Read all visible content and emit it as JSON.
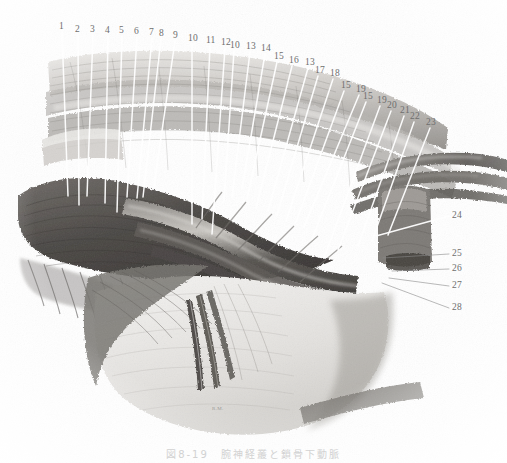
{
  "figure": {
    "type": "anatomical-plate-halftone",
    "title_caption": "図8-19　腕神経叢と鎖骨下動脈",
    "signature": "R.M.",
    "background_color": "#ffffff",
    "ink_color": "#555555",
    "leader_line_color_light": "#ffffff",
    "leader_line_color_dark": "#8a8a8a",
    "label_text_color": "#6e6e6e"
  },
  "labels": [
    {
      "id": "l1",
      "text": "1",
      "x": 59,
      "y": 22,
      "lx": 62,
      "ly": 32,
      "tx": 68,
      "ty": 196,
      "stroke": "light"
    },
    {
      "id": "l2",
      "text": "2",
      "x": 75,
      "y": 25,
      "lx": 78,
      "ly": 35,
      "tx": 79,
      "ty": 205,
      "stroke": "light"
    },
    {
      "id": "l3",
      "text": "3",
      "x": 90,
      "y": 25,
      "lx": 93,
      "ly": 35,
      "tx": 87,
      "ty": 196,
      "stroke": "light"
    },
    {
      "id": "l4",
      "text": "4",
      "x": 105,
      "y": 26,
      "lx": 108,
      "ly": 36,
      "tx": 105,
      "ty": 203,
      "stroke": "light"
    },
    {
      "id": "l5",
      "text": "5",
      "x": 119,
      "y": 26,
      "lx": 122,
      "ly": 36,
      "tx": 117,
      "ty": 212,
      "stroke": "light"
    },
    {
      "id": "l6",
      "text": "6",
      "x": 134,
      "y": 27,
      "lx": 137,
      "ly": 37,
      "tx": 127,
      "ty": 197,
      "stroke": "light"
    },
    {
      "id": "l7",
      "text": "7",
      "x": 149,
      "y": 28,
      "lx": 152,
      "ly": 38,
      "tx": 137,
      "ty": 198,
      "stroke": "light"
    },
    {
      "id": "l8",
      "text": "8",
      "x": 159,
      "y": 29,
      "lx": 161,
      "ly": 39,
      "tx": 143,
      "ty": 197,
      "stroke": "light"
    },
    {
      "id": "l9",
      "text": "9",
      "x": 173,
      "y": 31,
      "lx": 175,
      "ly": 41,
      "tx": 154,
      "ty": 186,
      "stroke": "light"
    },
    {
      "id": "l10a",
      "text": "10",
      "x": 188,
      "y": 34,
      "lx": 192,
      "ly": 44,
      "tx": 192,
      "ty": 224,
      "stroke": "light"
    },
    {
      "id": "l11",
      "text": "11",
      "x": 206,
      "y": 36,
      "lx": 210,
      "ly": 46,
      "tx": 202,
      "ty": 219,
      "stroke": "light"
    },
    {
      "id": "l12",
      "text": "12",
      "x": 221,
      "y": 38,
      "lx": 225,
      "ly": 48,
      "tx": 212,
      "ty": 234,
      "stroke": "light"
    },
    {
      "id": "l10b",
      "text": "10",
      "x": 230,
      "y": 41,
      "lx": 234,
      "ly": 51,
      "tx": 224,
      "ty": 201,
      "stroke": "light"
    },
    {
      "id": "l13a",
      "text": "13",
      "x": 246,
      "y": 42,
      "lx": 250,
      "ly": 52,
      "tx": 232,
      "ty": 197,
      "stroke": "light"
    },
    {
      "id": "l14",
      "text": "14",
      "x": 261,
      "y": 44,
      "lx": 265,
      "ly": 54,
      "tx": 242,
      "ty": 189,
      "stroke": "light"
    },
    {
      "id": "l15a",
      "text": "15",
      "x": 274,
      "y": 52,
      "lx": 277,
      "ly": 62,
      "tx": 247,
      "ty": 199,
      "stroke": "light"
    },
    {
      "id": "l16",
      "text": "16",
      "x": 289,
      "y": 56,
      "lx": 292,
      "ly": 66,
      "tx": 256,
      "ty": 208,
      "stroke": "light"
    },
    {
      "id": "l13b",
      "text": "13",
      "x": 305,
      "y": 58,
      "lx": 308,
      "ly": 68,
      "tx": 268,
      "ty": 211,
      "stroke": "light"
    },
    {
      "id": "l17",
      "text": "17",
      "x": 315,
      "y": 66,
      "lx": 318,
      "ly": 76,
      "tx": 277,
      "ty": 215,
      "stroke": "light"
    },
    {
      "id": "l18",
      "text": "18",
      "x": 330,
      "y": 69,
      "lx": 333,
      "ly": 79,
      "tx": 286,
      "ty": 221,
      "stroke": "light"
    },
    {
      "id": "l15b",
      "text": "15",
      "x": 341,
      "y": 81,
      "lx": 344,
      "ly": 91,
      "tx": 296,
      "ty": 222,
      "stroke": "light"
    },
    {
      "id": "l19a",
      "text": "19",
      "x": 356,
      "y": 85,
      "lx": 359,
      "ly": 95,
      "tx": 304,
      "ty": 227,
      "stroke": "light"
    },
    {
      "id": "l15c",
      "text": "15",
      "x": 363,
      "y": 92,
      "lx": 366,
      "ly": 102,
      "tx": 312,
      "ty": 239,
      "stroke": "light"
    },
    {
      "id": "l19b",
      "text": "19",
      "x": 377,
      "y": 96,
      "lx": 380,
      "ly": 106,
      "tx": 324,
      "ty": 258,
      "stroke": "light"
    },
    {
      "id": "l20",
      "text": "20",
      "x": 387,
      "y": 101,
      "lx": 391,
      "ly": 111,
      "tx": 338,
      "ty": 250,
      "stroke": "light"
    },
    {
      "id": "l21",
      "text": "21",
      "x": 400,
      "y": 106,
      "lx": 404,
      "ly": 116,
      "tx": 358,
      "ty": 246,
      "stroke": "light"
    },
    {
      "id": "l22",
      "text": "22",
      "x": 410,
      "y": 112,
      "lx": 414,
      "ly": 122,
      "tx": 372,
      "ty": 241,
      "stroke": "light"
    },
    {
      "id": "l23",
      "text": "23",
      "x": 426,
      "y": 118,
      "lx": 430,
      "ly": 128,
      "tx": 388,
      "ty": 235,
      "stroke": "light"
    },
    {
      "id": "l24",
      "text": "24",
      "x": 452,
      "y": 211,
      "lx": 449,
      "ly": 216,
      "tx": 376,
      "ty": 236,
      "stroke": "light"
    },
    {
      "id": "l25",
      "text": "25",
      "x": 452,
      "y": 249,
      "lx": 449,
      "ly": 254,
      "tx": 383,
      "ty": 258,
      "stroke": "dark"
    },
    {
      "id": "l26",
      "text": "26",
      "x": 452,
      "y": 264,
      "lx": 449,
      "ly": 269,
      "tx": 392,
      "ty": 271,
      "stroke": "dark"
    },
    {
      "id": "l27",
      "text": "27",
      "x": 452,
      "y": 281,
      "lx": 449,
      "ly": 286,
      "tx": 389,
      "ty": 278,
      "stroke": "dark"
    },
    {
      "id": "l28",
      "text": "28",
      "x": 452,
      "y": 303,
      "lx": 449,
      "ly": 308,
      "tx": 382,
      "ty": 283,
      "stroke": "dark"
    }
  ]
}
